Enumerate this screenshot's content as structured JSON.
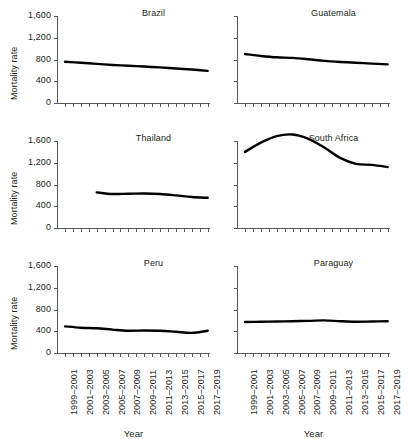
{
  "chart_data": {
    "type": "line",
    "title": "",
    "xlabel": "Year",
    "ylabel": "Mortality rate",
    "ylim": [
      0,
      1600
    ],
    "yticks": [
      0,
      400,
      800,
      1200,
      1600
    ],
    "ytick_labels": [
      "0",
      "400",
      "800",
      "1,200",
      "1,600"
    ],
    "grid": false,
    "legend": "none",
    "x": [
      "1999–2001",
      "2001–2003",
      "2003–2005",
      "2005–2007",
      "2007–2009",
      "2009–2011",
      "2011–2013",
      "2013–2015",
      "2015–2017",
      "2017–2019"
    ],
    "xtick_labels": [
      "1999–2001",
      "2001–2003",
      "2003–2005",
      "2005–2007",
      "2007–2009",
      "2009–2011",
      "2011–2013",
      "2013–2015",
      "2015–2017",
      "2017–2019"
    ],
    "panel_layout": "3 rows x 2 columns",
    "panels": [
      {
        "title": "Brazil",
        "row": 0,
        "col": 0,
        "series": [
          {
            "name": "Brazil",
            "x": [
              "1999–2001",
              "2001–2003",
              "2003–2005",
              "2005–2007",
              "2007–2009",
              "2009–2011",
              "2011–2013",
              "2013–2015",
              "2015–2017",
              "2017–2019"
            ],
            "values": [
              760,
              740,
              720,
              700,
              685,
              670,
              655,
              635,
              615,
              590
            ]
          }
        ]
      },
      {
        "title": "Guatemala",
        "row": 0,
        "col": 1,
        "series": [
          {
            "name": "Guatemala",
            "x": [
              "1999–2001",
              "2001–2003",
              "2003–2005",
              "2005–2007",
              "2007–2009",
              "2009–2011",
              "2011–2013",
              "2013–2015",
              "2015–2017",
              "2017–2019"
            ],
            "values": [
              900,
              865,
              840,
              830,
              805,
              775,
              755,
              740,
              725,
              710
            ]
          }
        ]
      },
      {
        "title": "Thailand",
        "row": 1,
        "col": 0,
        "series": [
          {
            "name": "Thailand",
            "x": [
              "2003–2005",
              "2005–2007",
              "2007–2009",
              "2009–2011",
              "2011–2013",
              "2013–2015",
              "2015–2017",
              "2017–2019"
            ],
            "values": [
              655,
              625,
              630,
              635,
              625,
              600,
              570,
              555
            ]
          }
        ]
      },
      {
        "title": "South Africa",
        "row": 1,
        "col": 1,
        "series": [
          {
            "name": "South Africa",
            "x": [
              "1999–2001",
              "2001–2003",
              "2003–2005",
              "2005–2007",
              "2007–2009",
              "2009–2011",
              "2011–2013",
              "2013–2015",
              "2015–2017",
              "2017–2019"
            ],
            "values": [
              1400,
              1570,
              1690,
              1720,
              1640,
              1480,
              1290,
              1180,
              1160,
              1120
            ]
          }
        ]
      },
      {
        "title": "Peru",
        "row": 2,
        "col": 0,
        "series": [
          {
            "name": "Peru",
            "x": [
              "1999–2001",
              "2001–2003",
              "2003–2005",
              "2005–2007",
              "2007–2009",
              "2009–2011",
              "2011–2013",
              "2013–2015",
              "2015–2017",
              "2017–2019"
            ],
            "values": [
              490,
              465,
              455,
              430,
              410,
              415,
              410,
              390,
              370,
              410
            ]
          }
        ]
      },
      {
        "title": "Paraguay",
        "row": 2,
        "col": 1,
        "series": [
          {
            "name": "Paraguay",
            "x": [
              "1999–2001",
              "2001–2003",
              "2003–2005",
              "2005–2007",
              "2007–2009",
              "2009–2011",
              "2011–2013",
              "2013–2015",
              "2015–2017",
              "2017–2019"
            ],
            "values": [
              570,
              575,
              580,
              585,
              590,
              600,
              585,
              575,
              580,
              585
            ]
          }
        ]
      }
    ],
    "colors": {
      "series_line": "#000000",
      "axis": "#58595b",
      "text": "#231f20",
      "background": "#ffffff"
    }
  }
}
